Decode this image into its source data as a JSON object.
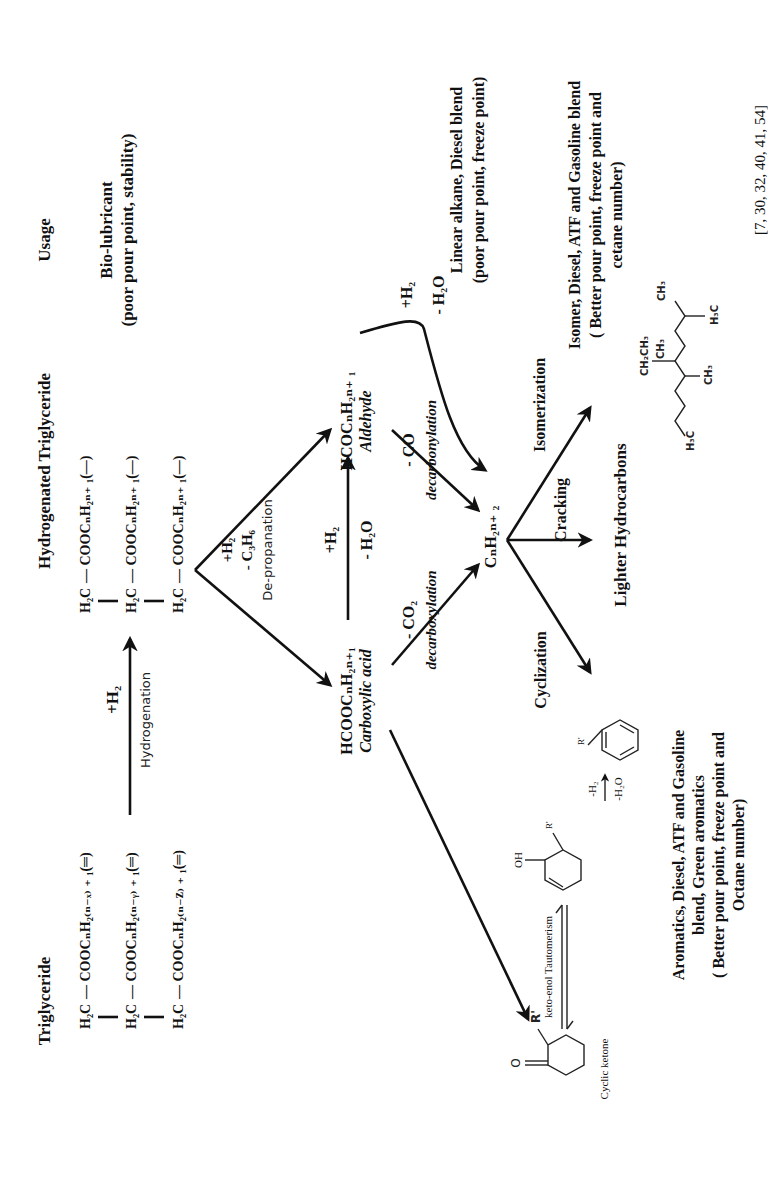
{
  "figure": {
    "orientation": "rotated 90deg counter-clockwise",
    "reference": "[7, 30, 32, 40, 41, 54]"
  },
  "columns": {
    "triglyceride": {
      "title": "Triglyceride",
      "rows": [
        {
          "head": "H₂C",
          "chain": "— COOCₙH₂₍ₙ₋ₓ₎ ₊ ₁(═)"
        },
        {
          "head": "H₂C",
          "chain": "— COOCₙH₂₍ₙ₋ᵧ₎ ₊ ₁(═)"
        },
        {
          "head": "H₂C",
          "chain": "— COOCₙH₂₍ₙ₋z₎ ₊ ₁(═)"
        }
      ]
    },
    "hydrogenation": {
      "reagent": "+H₂",
      "label": "Hydrogenation"
    },
    "hydrogenated_triglyceride": {
      "title": "Hydrogenated Triglyceride",
      "rows": [
        {
          "head": "H₂C",
          "chain": "— COOCₙH₂ₙ₊ ₁(—)"
        },
        {
          "head": "H₂C",
          "chain": "— COOCₙH₂ₙ₊ ₁(—)"
        },
        {
          "head": "H₂C",
          "chain": "— COOCₙH₂ₙ₊ ₁(—)"
        }
      ]
    },
    "usage": {
      "title": "Usage",
      "bio_lubricant": {
        "line1": "Bio-lubricant",
        "line2": "(poor pour point, stability)"
      }
    }
  },
  "depropanation": {
    "reagent1": "+H₂",
    "reagent2": "- C₃H₆",
    "label": "De-propanation"
  },
  "carboxylic_acid": {
    "formula": "HCOOCₙH₂ₙ₊₁",
    "name": "Carboxylic acid"
  },
  "aldehyde": {
    "formula": "HCOCₙH₂ₙ₊ ₁",
    "name": "Aldehyde"
  },
  "acid_to_aldehyde": {
    "reagent1": "+H₂",
    "reagent2": "- H₂O"
  },
  "decarboxylation": {
    "reagent": "- CO₂",
    "label": "decarboxylation"
  },
  "decarbonylation": {
    "reagent": "- CO",
    "label": "decarbonylation"
  },
  "hdo": {
    "reagent1": "+H₂",
    "reagent2": "- H₂O"
  },
  "alkane": {
    "formula": "CₙH₂ₙ₊ ₂",
    "usage_line1": "Linear alkane, Diesel blend",
    "usage_line2": "(poor pour point, freeze point)"
  },
  "processes": {
    "isomerization": "Isomerization",
    "cracking": "Cracking",
    "cyclization": "Cyclization"
  },
  "products": {
    "isomer": {
      "line1": "Isomer, Diesel, ATF and Gasoline blend",
      "line2": "( Better pour point, freeze point and",
      "line3": "cetane number)",
      "molecule_labels": [
        "CH₂CH₃",
        "CH₃",
        "CH₃",
        "H₃C",
        "CH₃",
        "H₃C"
      ]
    },
    "lighter": "Lighter Hydrocarbons",
    "aromatics": {
      "line1": "Aromatics, Diesel, ATF and Gasoline",
      "line2": "blend, Green aromatics",
      "line3": "( Better pour point, freeze point and",
      "line4": "Octane number)"
    }
  },
  "cyclic_path": {
    "ketone_label": "Cyclic ketone",
    "ketone_O": "O",
    "ketone_R": "R'",
    "tautomerism": "keto-enol Tautomerism",
    "enol_OH": "OH",
    "enol_R": "R'",
    "aromatization_reagent1": "-H₂",
    "aromatization_reagent2": "-H₂O",
    "aromatic_R": "R'"
  }
}
